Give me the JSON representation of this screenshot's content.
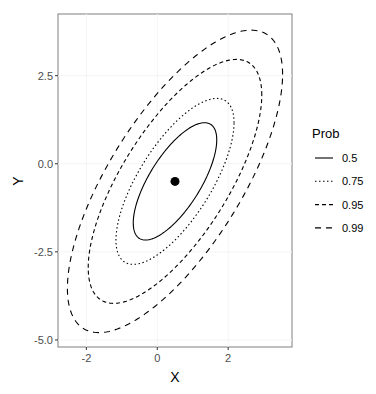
{
  "chart_data": {
    "type": "contour",
    "title": "",
    "xlabel": "X",
    "ylabel": "Y",
    "xlim": [
      -2.8,
      3.8
    ],
    "ylim": [
      -5.2,
      4.25
    ],
    "x_ticks": [
      -2,
      0,
      2
    ],
    "x_tick_labels": [
      "-2",
      "0",
      "2"
    ],
    "y_ticks": [
      2.5,
      0,
      -2.5,
      -5
    ],
    "y_tick_labels": [
      "2.5",
      "0.0",
      "-2.5",
      "-5.0"
    ],
    "grid": true,
    "center_point": {
      "x": 0.5,
      "y": -0.5
    },
    "covariance": {
      "sxx": 1.0,
      "syy": 2.0,
      "sxy": 1.0
    },
    "legend": {
      "title": "Prob",
      "position": "right",
      "entries": [
        {
          "label": "0.5",
          "prob": 0.5,
          "linetype": "solid"
        },
        {
          "label": "0.75",
          "prob": 0.75,
          "linetype": "dotted"
        },
        {
          "label": "0.95",
          "prob": 0.95,
          "linetype": "dashed"
        },
        {
          "label": "0.99",
          "prob": 0.99,
          "linetype": "longdash"
        }
      ]
    }
  }
}
